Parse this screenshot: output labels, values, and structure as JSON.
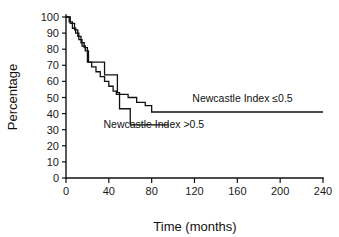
{
  "chart_data": {
    "type": "line",
    "title": "",
    "xlabel": "Time (months)",
    "ylabel": "Percentage",
    "xlim": [
      0,
      240
    ],
    "ylim": [
      0,
      100
    ],
    "xticks": [
      0,
      40,
      80,
      120,
      160,
      200,
      240
    ],
    "yticks": [
      0,
      10,
      20,
      30,
      40,
      50,
      60,
      70,
      80,
      90,
      100
    ],
    "xtick_labels": [
      "0",
      "40",
      "80",
      "120",
      "160",
      "200",
      "240"
    ],
    "ytick_labels": [
      "0",
      "10",
      "20",
      "30",
      "40",
      "50",
      "60",
      "70",
      "80",
      "90",
      "100"
    ],
    "grid": false,
    "legend_position": "inline-annotations",
    "drawstyle": "steps-post",
    "series": [
      {
        "name": "Newcastle Index ≤0.5",
        "annotation": "Newcastle Index ≤0.5",
        "annotation_x": 118,
        "annotation_y": 47,
        "x": [
          0,
          3,
          6,
          9,
          12,
          15,
          18,
          21,
          24,
          30,
          36,
          40,
          44,
          48,
          50,
          54,
          58,
          62,
          66,
          70,
          74,
          78,
          80,
          240
        ],
        "y": [
          100,
          97,
          93,
          90,
          86,
          82,
          79,
          72,
          72,
          72,
          64,
          64,
          64,
          53,
          52,
          52,
          50,
          50,
          47,
          47,
          45,
          45,
          41,
          41
        ]
      },
      {
        "name": "Newcastle Index >0.5",
        "annotation": "Newcastle Index >0.5",
        "annotation_x": 35,
        "annotation_y": 31,
        "x": [
          0,
          4,
          8,
          11,
          14,
          17,
          20,
          24,
          28,
          32,
          36,
          40,
          44,
          47,
          50,
          54,
          58,
          60,
          96
        ],
        "y": [
          100,
          96,
          92,
          88,
          84,
          81,
          72,
          69,
          66,
          63,
          60,
          57,
          54,
          52,
          43,
          43,
          43,
          33,
          33
        ]
      }
    ],
    "colors": {
      "series_stroke": "#111111",
      "background": "#ffffff",
      "axis": "#111111"
    }
  },
  "axis_titles": {
    "x": "Time (months)",
    "y": "Percentage"
  }
}
